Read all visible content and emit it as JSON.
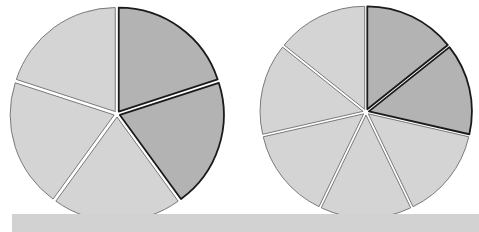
{
  "diagram": {
    "type": "fraction-pies",
    "colors": {
      "shaded_fill": "#b3b3b3",
      "unshaded_fill": "#d4d4d4",
      "shaded_stroke": "#1a1a1a",
      "unshaded_stroke": "#7a7a7a",
      "gap": "#ffffff",
      "bottom_bar": "#d2d2d2"
    },
    "pies": [
      {
        "name": "pie-fifths",
        "cx": 117,
        "cy": 114,
        "r": 104,
        "parts": 5,
        "shaded": 2,
        "explode": 3
      },
      {
        "name": "pie-sevenths",
        "cx": 366,
        "cy": 112,
        "r": 103,
        "parts": 7,
        "shaded": 2,
        "explode": 3
      }
    ]
  }
}
